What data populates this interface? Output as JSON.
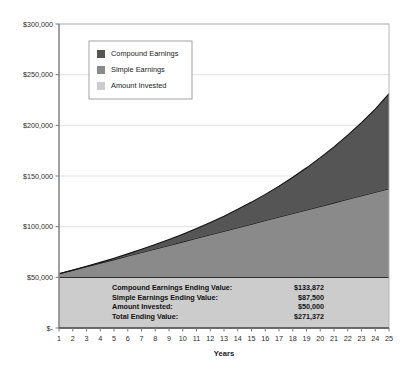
{
  "chart_data": {
    "type": "area",
    "stacked": true,
    "title": "",
    "xlabel": "Years",
    "ylabel": "",
    "grid": true,
    "legend_position": "inside-top-left",
    "x": [
      1,
      2,
      3,
      4,
      5,
      6,
      7,
      8,
      9,
      10,
      11,
      12,
      13,
      14,
      15,
      16,
      17,
      18,
      19,
      20,
      21,
      22,
      23,
      24,
      25
    ],
    "xticklabels": [
      "1",
      "2",
      "3",
      "4",
      "5",
      "6",
      "7",
      "8",
      "9",
      "10",
      "11",
      "12",
      "13",
      "14",
      "15",
      "16",
      "17",
      "18",
      "19",
      "20",
      "21",
      "22",
      "23",
      "24",
      "25"
    ],
    "xlim": [
      1,
      25
    ],
    "ylim": [
      0,
      300000
    ],
    "yticks": [
      0,
      50000,
      100000,
      150000,
      200000,
      250000,
      300000
    ],
    "yticklabels": [
      "$-",
      "$50,000",
      "$100,000",
      "$150,000",
      "$200,000",
      "$250,000",
      "$300,000"
    ],
    "series": [
      {
        "name": "Amount Invested",
        "color": "#cccccc",
        "values": [
          50000,
          50000,
          50000,
          50000,
          50000,
          50000,
          50000,
          50000,
          50000,
          50000,
          50000,
          50000,
          50000,
          50000,
          50000,
          50000,
          50000,
          50000,
          50000,
          50000,
          50000,
          50000,
          50000,
          50000,
          50000
        ]
      },
      {
        "name": "Simple Earnings",
        "color": "#8a8a8a",
        "values": [
          3500,
          7000,
          10500,
          14000,
          17500,
          21000,
          24500,
          28000,
          31500,
          35000,
          38500,
          42000,
          45500,
          49000,
          52500,
          56000,
          59500,
          63000,
          66500,
          70000,
          73500,
          77000,
          80500,
          84000,
          87500
        ]
      },
      {
        "name": "Compound Earnings",
        "color": "#555555",
        "values": [
          0,
          123,
          380,
          790,
          1370,
          2142,
          3126,
          4346,
          5826,
          7591,
          9670,
          12091,
          14886,
          18089,
          21735,
          25863,
          30515,
          35735,
          41572,
          48077,
          55307,
          63322,
          72186,
          81967,
          93872
        ]
      }
    ],
    "totals": [
      53500,
      57123,
      60880,
      64790,
      68870,
      73142,
      77626,
      82346,
      87326,
      92591,
      98170,
      104091,
      110386,
      117089,
      124235,
      131863,
      140015,
      148735,
      158072,
      168077,
      178807,
      190322,
      202686,
      215967,
      231372
    ],
    "legend": [
      {
        "label": "Compound Earnings",
        "color": "#555555"
      },
      {
        "label": "Simple Earnings",
        "color": "#8a8a8a"
      },
      {
        "label": "Amount Invested",
        "color": "#cccccc"
      }
    ],
    "annotations": {
      "summary_rows": [
        {
          "label": "Compound Earnings Ending Value:",
          "value": "$133,872"
        },
        {
          "label": "Simple Earnings Ending Value:",
          "value": "$87,500"
        },
        {
          "label": "Amount Invested:",
          "value": "$50,000"
        },
        {
          "label": "Total Ending Value:",
          "value": "$271,372"
        }
      ]
    }
  },
  "colors": {
    "compound": "#555555",
    "simple": "#8a8a8a",
    "invested": "#cccccc",
    "axis": "#808080",
    "grid": "#d9d9d9",
    "border": "#b0b0b0",
    "text": "#1a1a1a",
    "plot_background": "#ffffff"
  },
  "axis": {
    "x_title": "Years",
    "y_ticks": [
      "$300,000",
      "$250,000",
      "$200,000",
      "$150,000",
      "$100,000",
      "$50,000",
      "$-"
    ],
    "x_ticks": [
      "1",
      "2",
      "3",
      "4",
      "5",
      "6",
      "7",
      "8",
      "9",
      "10",
      "11",
      "12",
      "13",
      "14",
      "15",
      "16",
      "17",
      "18",
      "19",
      "20",
      "21",
      "22",
      "23",
      "24",
      "25"
    ]
  },
  "legend": {
    "items": [
      {
        "label": "Compound Earnings"
      },
      {
        "label": "Simple Earnings"
      },
      {
        "label": "Amount Invested"
      }
    ]
  },
  "summary": {
    "rows": [
      {
        "label": "Compound Earnings Ending Value:",
        "value": "$133,872"
      },
      {
        "label": "Simple Earnings Ending Value:",
        "value": "$87,500"
      },
      {
        "label": "Amount Invested:",
        "value": "$50,000"
      },
      {
        "label": "Total Ending Value:",
        "value": "$271,372"
      }
    ]
  }
}
